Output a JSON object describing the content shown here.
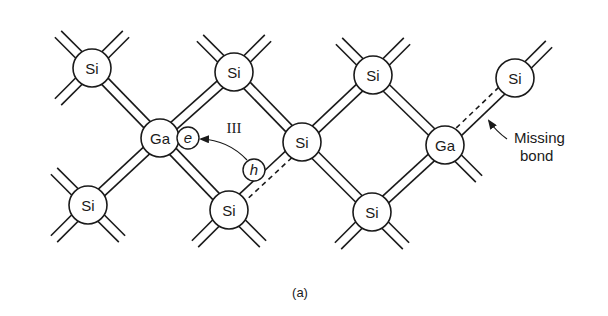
{
  "figure": {
    "caption": "(a)",
    "stroke_color": "#1a1a1a",
    "background": "#ffffff",
    "atom_radius": 19,
    "bond_half_gap": 4.5
  },
  "atoms": [
    {
      "id": "si1",
      "label": "Si",
      "x": 92,
      "y": 68
    },
    {
      "id": "si2",
      "label": "Si",
      "x": 234,
      "y": 72
    },
    {
      "id": "si3",
      "label": "Si",
      "x": 373,
      "y": 75
    },
    {
      "id": "si4",
      "label": "Si",
      "x": 515,
      "y": 78
    },
    {
      "id": "ga1",
      "label": "Ga",
      "x": 160,
      "y": 138
    },
    {
      "id": "si5",
      "label": "Si",
      "x": 302,
      "y": 142
    },
    {
      "id": "ga2",
      "label": "Ga",
      "x": 445,
      "y": 145
    },
    {
      "id": "si6",
      "label": "Si",
      "x": 88,
      "y": 205
    },
    {
      "id": "si7",
      "label": "Si",
      "x": 229,
      "y": 210
    },
    {
      "id": "si8",
      "label": "Si",
      "x": 372,
      "y": 212
    }
  ],
  "bonds": [
    {
      "from": "si1",
      "to": "ga1"
    },
    {
      "from": "si2",
      "to": "ga1"
    },
    {
      "from": "si2",
      "to": "si5"
    },
    {
      "from": "si3",
      "to": "si5"
    },
    {
      "from": "si3",
      "to": "ga2"
    },
    {
      "from": "si4",
      "to": "ga2",
      "missing_side": 1
    },
    {
      "from": "ga1",
      "to": "si6"
    },
    {
      "from": "ga1",
      "to": "si7"
    },
    {
      "from": "si5",
      "to": "si7",
      "missing_side": -1
    },
    {
      "from": "si5",
      "to": "si8"
    },
    {
      "from": "ga2",
      "to": "si8"
    }
  ],
  "stubs": [
    {
      "atom": "si1",
      "dx": -1,
      "dy": -1
    },
    {
      "atom": "si1",
      "dx": 1,
      "dy": -1
    },
    {
      "atom": "si1",
      "dx": -1,
      "dy": 1
    },
    {
      "atom": "si2",
      "dx": -1,
      "dy": -1
    },
    {
      "atom": "si2",
      "dx": 1,
      "dy": -1
    },
    {
      "atom": "si3",
      "dx": -1,
      "dy": -1
    },
    {
      "atom": "si3",
      "dx": 1,
      "dy": -1
    },
    {
      "atom": "si4",
      "dx": 1,
      "dy": -1
    },
    {
      "atom": "ga2",
      "dx": 1,
      "dy": 1
    },
    {
      "atom": "si6",
      "dx": -1,
      "dy": -1
    },
    {
      "atom": "si6",
      "dx": -1,
      "dy": 1
    },
    {
      "atom": "si6",
      "dx": 1,
      "dy": 1
    },
    {
      "atom": "si7",
      "dx": -1,
      "dy": 1
    },
    {
      "atom": "si7",
      "dx": 1,
      "dy": 1
    },
    {
      "atom": "si8",
      "dx": -1,
      "dy": 1
    },
    {
      "atom": "si8",
      "dx": 1,
      "dy": 1
    }
  ],
  "stub_length": 48,
  "carriers": [
    {
      "id": "electron",
      "label": "e",
      "x": 188,
      "y": 138,
      "r": 11
    },
    {
      "id": "hole",
      "label": "h",
      "x": 254,
      "y": 170,
      "r": 11
    }
  ],
  "annotations": {
    "group_label": {
      "text": "III",
      "x": 234,
      "y": 133
    },
    "missing_bond": {
      "line1": "Missing",
      "line2": "bond",
      "x": 514,
      "y1": 143,
      "y2": 161
    }
  }
}
